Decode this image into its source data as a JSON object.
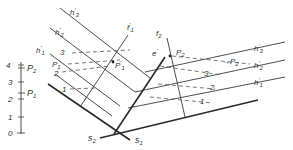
{
  "diagram": {
    "type": "descriptive-geometry-plane-traces",
    "scale": {
      "ticks": [
        "0",
        "1",
        "2",
        "3",
        "4"
      ],
      "markers": [
        {
          "label": "P",
          "sub": "1",
          "value": 2.4
        },
        {
          "label": "P",
          "sub": "2",
          "value": 3.8
        }
      ]
    },
    "traces": {
      "s1": {
        "label": "s",
        "sub": "1"
      },
      "s2": {
        "label": "s",
        "sub": "2"
      }
    },
    "left_view": {
      "contours": [
        {
          "label": "h",
          "sup": "'",
          "sub": "3"
        },
        {
          "label": "h",
          "sup": "'",
          "sub": "2"
        },
        {
          "label": "h",
          "sup": "'",
          "sub": "1"
        }
      ],
      "line_f": {
        "label": "f",
        "sup": "'",
        "sub": "1"
      },
      "points": [
        {
          "label": "P",
          "sub": "1"
        },
        {
          "label": "P",
          "sup": "'",
          "sub": "1"
        }
      ],
      "heights": [
        "3",
        "2",
        "1"
      ]
    },
    "right_view": {
      "contours": [
        {
          "label": "h",
          "sup": "'",
          "sub": "3"
        },
        {
          "label": "h",
          "sup": "'",
          "sub": "2"
        },
        {
          "label": "h",
          "sup": "'",
          "sub": "1"
        }
      ],
      "line_f": {
        "label": "f",
        "sub": "2"
      },
      "line_e": {
        "label": "e",
        "sup": "'"
      },
      "points": [
        {
          "label": "P",
          "sub": "2"
        },
        {
          "label": "P",
          "sub": "2",
          "arrow": true
        }
      ],
      "heights": [
        "3",
        "2",
        "1"
      ]
    }
  }
}
